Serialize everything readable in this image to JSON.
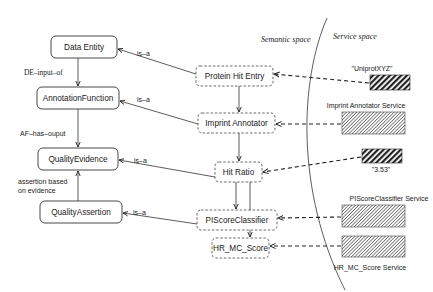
{
  "diagram": {
    "regions": {
      "semantic_label": "Semantic space",
      "service_label": "Service space"
    },
    "ontology_nodes": [
      {
        "id": "data-entity",
        "label": "Data Entity"
      },
      {
        "id": "annotation-function",
        "label": "AnnotationFunction"
      },
      {
        "id": "quality-evidence",
        "label": "QualityEvidence"
      },
      {
        "id": "quality-assertion",
        "label": "QualityAssertion"
      }
    ],
    "ontology_edges": [
      {
        "from": "data-entity",
        "to": "annotation-function",
        "label": "DE–input–of"
      },
      {
        "from": "annotation-function",
        "to": "quality-evidence",
        "label": "AF–has–ouput"
      },
      {
        "from": "quality-assertion",
        "to": "quality-evidence",
        "label_line1": "assertion based",
        "label_line2": "on evidence"
      }
    ],
    "instance_nodes": [
      {
        "id": "protein-hit-entry",
        "label": "Protein Hit Entry"
      },
      {
        "id": "imprint-annotator",
        "label": "Imprint Annotator"
      },
      {
        "id": "hit-ratio",
        "label": "Hit Ratio"
      },
      {
        "id": "piscore-classifier",
        "label": "PIScoreClassifier"
      },
      {
        "id": "hr-mc-score",
        "label": "HR_MC_Score"
      }
    ],
    "isa_label": "is–a",
    "service_nodes": [
      {
        "id": "uniprot-xyz",
        "label": "\"UniprotXYZ\"",
        "style": "data"
      },
      {
        "id": "imprint-annotator-service",
        "label": "Imprint Annotator Service",
        "style": "service"
      },
      {
        "id": "value-3-53",
        "label": "\"3.53\"",
        "style": "data"
      },
      {
        "id": "piscore-classifier-service",
        "label": "PIScoreClassifier Service",
        "style": "service"
      },
      {
        "id": "hr-mc-score-service",
        "label": "HR_MC_Score Service",
        "style": "service"
      }
    ]
  }
}
